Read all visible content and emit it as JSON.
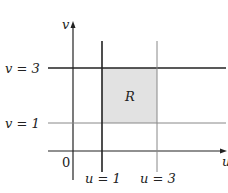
{
  "diagram": {
    "axes": {
      "x_label": "u",
      "y_label": "v",
      "origin_label": "0"
    },
    "lines": {
      "v3": "v = 3",
      "v1": "v = 1",
      "u1": "u = 1",
      "u3": "u = 3"
    },
    "region_label": "R",
    "colors": {
      "region": "#e2e2e2",
      "line": "#222222"
    }
  }
}
